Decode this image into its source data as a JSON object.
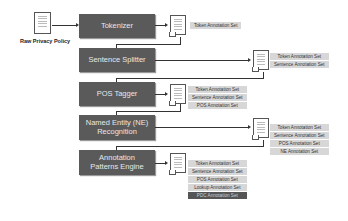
{
  "diagram": {
    "input": {
      "label": "Raw Privacy Policy",
      "icon": "document-icon"
    },
    "stages": [
      {
        "name": "Tokenizer",
        "outputs": [
          "Token Annotation Set"
        ]
      },
      {
        "name": "Sentence Splitter",
        "outputs": [
          "Token Annotation Set",
          "Sentence Annotation Set"
        ]
      },
      {
        "name": "POS Tagger",
        "outputs": [
          "Token Annotation Set",
          "Sentence Annotation Set",
          "POS Annotation Set"
        ]
      },
      {
        "name": "Named Entity (NE) Recognition",
        "outputs": [
          "Token Annotation Set",
          "Sentence Annotation Set",
          "POS Annotation Set",
          "NE Annotation Set"
        ]
      },
      {
        "name": "Annotation Patterns Engine",
        "outputs": [
          "Token Annotation Set",
          "Sentence Annotation Set",
          "POS Annotation Set",
          "Lookup Annotation Set",
          "PDC Annotation Set"
        ]
      }
    ],
    "colors": {
      "process_box": "#5a5a5a",
      "label_box": "#d7d7d7",
      "final_label_box": "#555555"
    }
  }
}
